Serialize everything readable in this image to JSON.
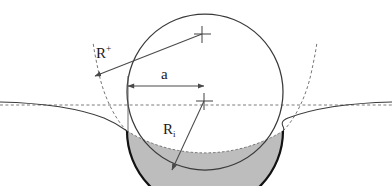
{
  "figure": {
    "background_color": "#ffffff",
    "width": 392,
    "height": 186
  },
  "labels": {
    "radius_plus": {
      "base": "R",
      "script": "+",
      "text": "R+"
    },
    "contact_radius": {
      "text": "a"
    },
    "radius_indent": {
      "base": "R",
      "script": "i",
      "text": "Ri"
    }
  },
  "colors": {
    "outline": "#3a3a3a",
    "indent_arc": "#1a1a1a",
    "dashed": "#555555",
    "baseline": "#666666",
    "shaded_fill": "#bdbdbd",
    "arrow": "#4a4a4a",
    "text": "#1a1a1a"
  },
  "geometry": {
    "sphere": {
      "cx": 205,
      "cy": 92,
      "r": 78
    },
    "baseline_y": 105,
    "contact_left": {
      "x": 127,
      "y": 131
    },
    "contact_right": {
      "x": 283,
      "y": 131
    },
    "crosshair_upper": {
      "x": 202,
      "y": 34
    },
    "crosshair_lower": {
      "x": 204,
      "y": 101
    },
    "arrow_a": {
      "x1": 128,
      "x2": 204,
      "y": 86
    },
    "arrow_rplus": {
      "x1": 202,
      "y1": 34,
      "x2": 95,
      "y2": 76
    },
    "arrow_ri": {
      "x1": 204,
      "y1": 101,
      "x2": 172,
      "y2": 170
    }
  },
  "elements": {
    "sphere_outline": "indenter-circle",
    "surface_profile": "deformed-surface-curve",
    "original_profile": "undeformed-dashed-arc",
    "shaded_region": "indentation-lens-area",
    "baseline": "dashed-horizontal-datum"
  }
}
